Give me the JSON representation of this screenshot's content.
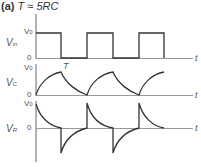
{
  "title": {
    "panel": "(a)",
    "equation": "T ≈ 5RC"
  },
  "plots": [
    {
      "name": "vin",
      "ylabel_main": "V",
      "ylabel_sub": "in",
      "tick_top": "V",
      "tick_top_sub": "0",
      "tick_zero": "0",
      "xlabel": "t"
    },
    {
      "name": "vc",
      "ylabel_main": "V",
      "ylabel_sub": "C",
      "tick_top": "V",
      "tick_top_sub": "0",
      "tick_zero": "0",
      "xlabel": "t",
      "annotation": "T"
    },
    {
      "name": "vr",
      "ylabel_main": "V",
      "ylabel_sub": "R",
      "tick_top": "V",
      "tick_top_sub": "0",
      "tick_zero": "0",
      "xlabel": "t"
    }
  ],
  "colors": {
    "trace": "#333333",
    "axis": "#666666",
    "text": "#555555"
  }
}
